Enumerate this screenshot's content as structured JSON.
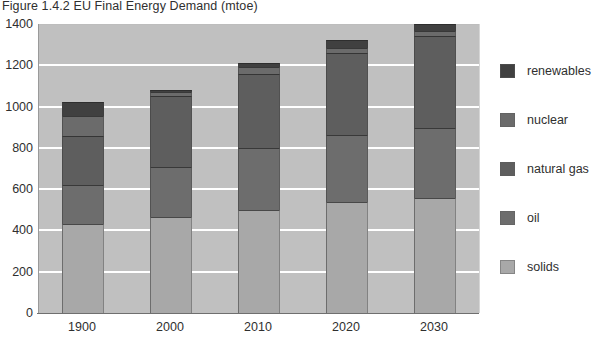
{
  "chart_data": {
    "type": "bar",
    "title": "Figure 1.4.2 EU Final Energy Demand (mtoe)",
    "xlabel": "",
    "ylabel": "",
    "stacked": true,
    "grid": true,
    "legend_position": "right",
    "ylim": [
      0,
      1400
    ],
    "ytick_labels": [
      "1400",
      "1200",
      "1000",
      "800",
      "600",
      "400",
      "200",
      "0"
    ],
    "ytick_values": [
      1400,
      1200,
      1000,
      800,
      600,
      400,
      200,
      0
    ],
    "categories": [
      "1900",
      "2000",
      "2010",
      "2020",
      "2030"
    ],
    "series": [
      {
        "name": "solids",
        "color": "#a8a8a8",
        "values": [
          430,
          465,
          500,
          540,
          555
        ]
      },
      {
        "name": "oil",
        "color": "#6d6d6d",
        "values": [
          190,
          240,
          300,
          320,
          340
        ]
      },
      {
        "name": "natural gas",
        "color": "#5e5e5e",
        "values": [
          240,
          345,
          360,
          400,
          445
        ]
      },
      {
        "name": "nuclear",
        "color": "#6b6b6b",
        "values": [
          95,
          20,
          30,
          25,
          25
        ]
      },
      {
        "name": "renewables",
        "color": "#404040",
        "values": [
          65,
          10,
          20,
          40,
          35
        ]
      }
    ],
    "totals": [
      1020,
      1080,
      1210,
      1325,
      1400
    ],
    "stack_order_bottom_to_top": [
      "solids",
      "oil",
      "natural gas",
      "nuclear",
      "renewables"
    ],
    "legend_order_top_to_bottom": [
      "renewables",
      "nuclear",
      "natural gas",
      "oil",
      "solids"
    ]
  },
  "style": {
    "plot_background": "#c0c0c0",
    "gridline_color": "#ffffff",
    "axis_color": "#6f6f6f",
    "text_color": "#2f2f2f",
    "page_background": "#ffffff"
  }
}
